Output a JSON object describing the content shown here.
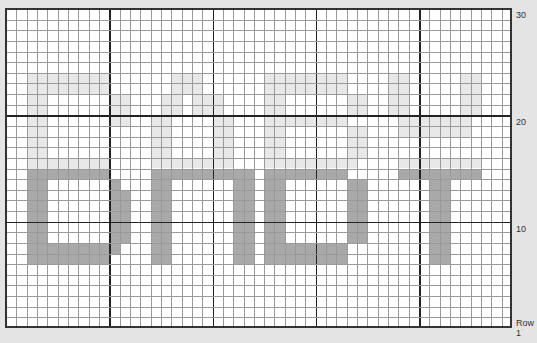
{
  "chart_data": {
    "type": "table",
    "title": "",
    "columns": 49,
    "rows": 30,
    "row_labels": [
      {
        "row": 30,
        "label": "30"
      },
      {
        "row": 20,
        "label": "20"
      },
      {
        "row": 10,
        "label": "10"
      },
      {
        "row": 1,
        "label": "Row 1"
      }
    ],
    "major_grid_every": 10,
    "colors": {
      "background": "#e4e4e4",
      "grid": "#9a9a9a",
      "major_grid": "#222222",
      "light_fill": "#e8e8e8",
      "dark_fill": "#a9a9a9"
    },
    "light_cells": [
      [
        2,
        6,
        8,
        2
      ],
      [
        2,
        8,
        2,
        8
      ],
      [
        10,
        8,
        2,
        3
      ],
      [
        2,
        14,
        8,
        2
      ],
      [
        16,
        6,
        3,
        2
      ],
      [
        15,
        8,
        2,
        2
      ],
      [
        18,
        8,
        3,
        2
      ],
      [
        14,
        10,
        2,
        4
      ],
      [
        20,
        10,
        2,
        4
      ],
      [
        14,
        14,
        8,
        1
      ],
      [
        25,
        6,
        8,
        2
      ],
      [
        25,
        8,
        2,
        6
      ],
      [
        33,
        8,
        2,
        2
      ],
      [
        27,
        10,
        6,
        1
      ],
      [
        33,
        11,
        2,
        3
      ],
      [
        25,
        14,
        9,
        1
      ],
      [
        37,
        6,
        2,
        4
      ],
      [
        44,
        6,
        2,
        4
      ],
      [
        38,
        10,
        7,
        2
      ],
      [
        38,
        14,
        8,
        1
      ]
    ],
    "dark_cells": [
      [
        2,
        15,
        8,
        1
      ],
      [
        2,
        16,
        2,
        6
      ],
      [
        10,
        16,
        1,
        7
      ],
      [
        11,
        17,
        1,
        5
      ],
      [
        2,
        22,
        8,
        2
      ],
      [
        14,
        15,
        10,
        1
      ],
      [
        14,
        16,
        2,
        8
      ],
      [
        22,
        16,
        2,
        8
      ],
      [
        25,
        15,
        8,
        1
      ],
      [
        25,
        16,
        2,
        8
      ],
      [
        33,
        16,
        2,
        6
      ],
      [
        27,
        22,
        6,
        2
      ],
      [
        38,
        15,
        8,
        1
      ],
      [
        41,
        16,
        2,
        8
      ]
    ]
  },
  "labels": {
    "r30": "30",
    "r20": "20",
    "r10": "10",
    "r1": "Row 1"
  }
}
